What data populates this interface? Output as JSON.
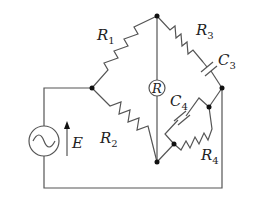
{
  "diagram": {
    "type": "circuit",
    "title": "",
    "components": {
      "R1": {
        "symbol": "R",
        "sub": "1",
        "kind": "resistor"
      },
      "R2": {
        "symbol": "R",
        "sub": "2",
        "kind": "resistor"
      },
      "R3": {
        "symbol": "R",
        "sub": "3",
        "kind": "resistor"
      },
      "R4": {
        "symbol": "R",
        "sub": "4",
        "kind": "resistor"
      },
      "C3": {
        "symbol": "C",
        "sub": "3",
        "kind": "capacitor"
      },
      "C4": {
        "symbol": "C",
        "sub": "4",
        "kind": "capacitor"
      },
      "meter": {
        "symbol": "R",
        "kind": "detector"
      },
      "source": {
        "symbol": "E",
        "kind": "ac-source"
      }
    },
    "colors": {
      "wire": "#555555",
      "node": "#111111",
      "background": "#ffffff"
    }
  }
}
